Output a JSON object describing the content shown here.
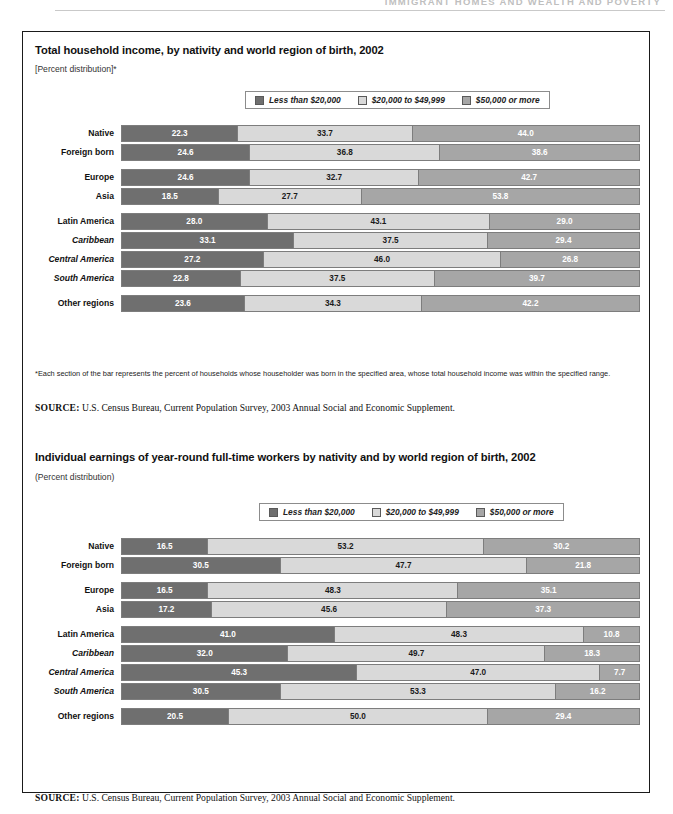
{
  "page_header": {
    "text": "IMMIGRANT HOMES AND WEALTH AND POVERTY"
  },
  "legend_items": [
    {
      "label": "Less than $20,000",
      "color": "#6f6f6f",
      "key": "lt20k"
    },
    {
      "label": "$20,000 to $49,999",
      "color": "#d9d9d9",
      "key": "20k_50k"
    },
    {
      "label": "$50,000 or more",
      "color": "#a6a6a6",
      "key": "gte50k"
    }
  ],
  "panel1": {
    "title": "Total household income, by nativity and world region of birth, 2002",
    "subtitle": "[Percent distribution]*",
    "footnote": "*Each section of the bar represents the percent of households whose householder was born in the specified area, whose total household income was within the specified range.",
    "source_label": "SOURCE:",
    "source_text": "U.S. Census Bureau, Current Population Survey, 2003 Annual Social and Economic Supplement."
  },
  "panel2": {
    "title": "Individual earnings of year-round full-time workers by nativity and by world region of birth, 2002",
    "subtitle": "(Percent distribution)",
    "source_label": "SOURCE:",
    "source_text": "U.S. Census Bureau, Current Population Survey, 2003 Annual Social and Economic Supplement."
  },
  "chart_data": [
    {
      "id": "household-income",
      "type": "bar",
      "orientation": "horizontal",
      "stacked": true,
      "normalized_percent": true,
      "title": "Total household income, by nativity and world region of birth, 2002",
      "subtitle": "[Percent distribution]*",
      "xlabel": "",
      "ylabel": "",
      "xlim": [
        0,
        100
      ],
      "grid": false,
      "legend_position": "top-right",
      "categories": [
        "Native",
        "Foreign born",
        "Europe",
        "Asia",
        "Latin America",
        "Caribbean",
        "Central America",
        "South America",
        "Other regions"
      ],
      "category_styles": [
        "bold",
        "bold",
        "bold",
        "bold",
        "bold",
        "italic",
        "italic",
        "italic",
        "bold"
      ],
      "group_breaks_after": [
        "Foreign born",
        "Asia",
        "South America"
      ],
      "series": [
        {
          "name": "Less than $20,000",
          "color": "#6f6f6f",
          "values": [
            22.3,
            24.6,
            24.6,
            18.5,
            28.0,
            33.1,
            27.2,
            22.8,
            23.6
          ]
        },
        {
          "name": "$20,000 to $49,999",
          "color": "#d9d9d9",
          "values": [
            33.7,
            36.8,
            32.7,
            27.7,
            43.1,
            37.5,
            46.0,
            37.5,
            34.3
          ]
        },
        {
          "name": "$50,000 or more",
          "color": "#a6a6a6",
          "values": [
            44.0,
            38.6,
            42.7,
            53.8,
            29.0,
            29.4,
            26.8,
            39.7,
            42.2
          ]
        }
      ]
    },
    {
      "id": "individual-earnings",
      "type": "bar",
      "orientation": "horizontal",
      "stacked": true,
      "normalized_percent": true,
      "title": "Individual earnings of year-round full-time workers by nativity and by world region of birth, 2002",
      "subtitle": "(Percent distribution)",
      "xlabel": "",
      "ylabel": "",
      "xlim": [
        0,
        100
      ],
      "grid": false,
      "legend_position": "top-right",
      "categories": [
        "Native",
        "Foreign born",
        "Europe",
        "Asia",
        "Latin America",
        "Caribbean",
        "Central America",
        "South America",
        "Other regions"
      ],
      "category_styles": [
        "bold",
        "bold",
        "bold",
        "bold",
        "bold",
        "italic",
        "italic",
        "italic",
        "bold"
      ],
      "group_breaks_after": [
        "Foreign born",
        "Asia",
        "South America"
      ],
      "series": [
        {
          "name": "Less than $20,000",
          "color": "#6f6f6f",
          "values": [
            16.5,
            30.5,
            16.5,
            17.2,
            41.0,
            32.0,
            45.3,
            30.5,
            20.5
          ]
        },
        {
          "name": "$20,000 to $49,999",
          "color": "#d9d9d9",
          "values": [
            53.2,
            47.7,
            48.3,
            45.6,
            48.3,
            49.7,
            47.0,
            53.3,
            50.0
          ]
        },
        {
          "name": "$50,000 or more",
          "color": "#a6a6a6",
          "values": [
            30.2,
            21.8,
            35.1,
            37.3,
            10.8,
            18.3,
            7.7,
            16.2,
            29.4
          ]
        }
      ]
    }
  ]
}
